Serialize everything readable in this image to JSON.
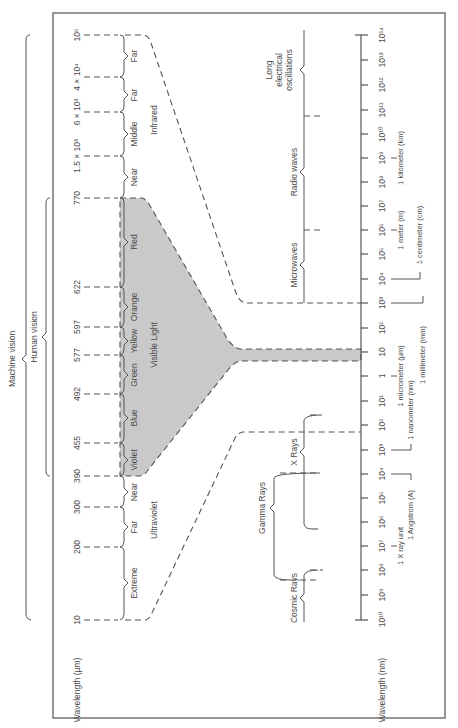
{
  "figure": {
    "orientation": "rotated 90 degrees counter-clockwise",
    "colors": {
      "visible_light_fill": "#c9c9c9",
      "line": "#555555",
      "frame": "#6a6a6a"
    }
  },
  "top_scale": {
    "axis_label": "Wavelength (µm)",
    "ticks": [
      {
        "label": "10",
        "y": 620
      },
      {
        "label": "200",
        "y": 547
      },
      {
        "label": "300",
        "y": 507
      },
      {
        "label": "390",
        "y": 476
      },
      {
        "label": "455",
        "y": 443
      },
      {
        "label": "492",
        "y": 394
      },
      {
        "label": "577",
        "y": 355
      },
      {
        "label": "597",
        "y": 327
      },
      {
        "label": "622",
        "y": 287
      },
      {
        "label": "770",
        "y": 198
      },
      {
        "label": "1.5 × 10³",
        "y": 156
      },
      {
        "label": "6 × 10³",
        "y": 112
      },
      {
        "label": "4 × 10⁴",
        "y": 77
      },
      {
        "label": "10⁶",
        "y": 35
      }
    ],
    "bands": [
      {
        "label": "Extreme",
        "y": 583
      },
      {
        "label": "Far",
        "y": 527
      },
      {
        "label": "Near",
        "y": 492
      },
      {
        "label": "Violet",
        "y": 460
      },
      {
        "label": "Blue",
        "y": 418
      },
      {
        "label": "Green",
        "y": 375
      },
      {
        "label": "Yellow",
        "y": 341
      },
      {
        "label": "Orange",
        "y": 307
      },
      {
        "label": "Red",
        "y": 242
      },
      {
        "label": "Near",
        "y": 177
      },
      {
        "label": "Middle",
        "y": 134
      },
      {
        "label": "Far",
        "y": 95
      },
      {
        "label": "Far",
        "y": 56
      }
    ],
    "regions": [
      {
        "label": "Ultraviolet",
        "y": 520
      },
      {
        "label": "Visible Light",
        "y": 345
      },
      {
        "label": "Infrared",
        "y": 120
      }
    ]
  },
  "vision_ranges": {
    "machine_vision": "Machine vision",
    "human_vision": "Human vision"
  },
  "bottom_scale": {
    "axis_label": "Wavelength (nm)",
    "ticks": [
      {
        "label": "10¹⁰",
        "y": 619
      },
      {
        "label": "10⁹",
        "y": 595
      },
      {
        "label": "10⁸",
        "y": 570
      },
      {
        "label": "10⁷",
        "y": 546
      },
      {
        "label": "10⁶",
        "y": 522
      },
      {
        "label": "10⁵",
        "y": 498
      },
      {
        "label": "10⁴",
        "y": 474
      },
      {
        "label": "10³",
        "y": 450
      },
      {
        "label": "10²",
        "y": 425
      },
      {
        "label": "10¹",
        "y": 401
      },
      {
        "label": "1",
        "y": 376
      },
      {
        "label": "10",
        "y": 352
      },
      {
        "label": "10²",
        "y": 328
      },
      {
        "label": "10³",
        "y": 303
      },
      {
        "label": "10⁴",
        "y": 279
      },
      {
        "label": "10⁵",
        "y": 254
      },
      {
        "label": "10⁶",
        "y": 230
      },
      {
        "label": "10⁷",
        "y": 206
      },
      {
        "label": "10⁸",
        "y": 182
      },
      {
        "label": "10⁹",
        "y": 158
      },
      {
        "label": "10¹⁰",
        "y": 134
      },
      {
        "label": "10¹¹",
        "y": 110
      },
      {
        "label": "10¹²",
        "y": 85
      },
      {
        "label": "10¹³",
        "y": 60
      },
      {
        "label": "10¹⁴",
        "y": 35
      }
    ],
    "unit_markers": [
      {
        "label": "1 X ray unit",
        "y": 546
      },
      {
        "label": "1 Angstrom (A)",
        "y": 474
      },
      {
        "label": "1 nanometer (nm)",
        "y": 401
      },
      {
        "label": "1 micrometer (µm)",
        "y": 376
      },
      {
        "label": "1 millimeter (mm)",
        "y": 328
      },
      {
        "label": "1 centimeter (cm)",
        "y": 279
      },
      {
        "label": "1 meter (m)",
        "y": 230
      },
      {
        "label": "1 kilometer (km)",
        "y": 158
      }
    ],
    "regions": [
      {
        "label": "Cosmic Rays",
        "y": 598
      },
      {
        "label": "Gamma Rays",
        "y": 508
      },
      {
        "label": "X Rays",
        "y": 452
      },
      {
        "label": "Microwaves",
        "y": 265
      },
      {
        "label": "Radio waves",
        "y": 172
      },
      {
        "label": "Long electrical oscillations",
        "y": 70
      }
    ]
  }
}
